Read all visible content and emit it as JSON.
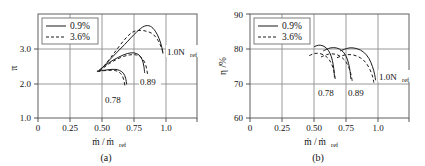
{
  "figure": {
    "panel_count": 2
  },
  "chart_data": [
    {
      "type": "line",
      "panel": "a",
      "caption": "(a)",
      "title": "",
      "xlabel": "ṁ / ṁref",
      "xlabel_main": "ṁ / ṁ",
      "xlabel_sub": "ref",
      "ylabel": "π",
      "xlim": [
        0,
        1.22
      ],
      "ylim": [
        1.0,
        3.97
      ],
      "xticks": [
        0,
        0.25,
        0.5,
        0.75,
        1.0
      ],
      "xtick_labels": [
        "0",
        "0.25",
        "0.50",
        "0.75",
        "1.0"
      ],
      "yticks": [
        1.0,
        2.0,
        3.0
      ],
      "ytick_labels": [
        "1.0",
        "2.0",
        "3.0"
      ],
      "grid": true,
      "legend_position": "top-left",
      "legend": [
        {
          "label": "0.9%",
          "style": "solid"
        },
        {
          "label": "3.6%",
          "style": "dashed"
        }
      ],
      "annotations": [
        {
          "text": "1.0Nref",
          "text_main": "1.0N",
          "text_sub": "ref",
          "x": 1.02,
          "y": 2.73
        },
        {
          "text": "0.89",
          "x": 0.84,
          "y": 2.13
        },
        {
          "text": "0.78",
          "x": 0.59,
          "y": 1.61
        }
      ],
      "series": [
        {
          "name": "0.78 speedline, 0.9%",
          "style": "solid",
          "speed": "0.78",
          "tip": "0.9%",
          "points": [
            [
              0.455,
              2.34
            ],
            [
              0.5,
              2.36
            ],
            [
              0.545,
              2.38
            ],
            [
              0.59,
              2.39
            ],
            [
              0.625,
              2.36
            ],
            [
              0.655,
              2.28
            ],
            [
              0.672,
              2.14
            ],
            [
              0.68,
              1.97
            ]
          ]
        },
        {
          "name": "0.78 speedline, 3.6%",
          "style": "dashed",
          "speed": "0.78",
          "tip": "3.6%",
          "points": [
            [
              0.455,
              2.33
            ],
            [
              0.5,
              2.35
            ],
            [
              0.545,
              2.36
            ],
            [
              0.585,
              2.36
            ],
            [
              0.618,
              2.32
            ],
            [
              0.645,
              2.22
            ],
            [
              0.66,
              2.06
            ],
            [
              0.666,
              1.92
            ]
          ]
        },
        {
          "name": "0.89 speedline, 0.9%",
          "style": "solid",
          "speed": "0.89",
          "tip": "0.9%",
          "points": [
            [
              0.47,
              2.37
            ],
            [
              0.545,
              2.58
            ],
            [
              0.62,
              2.74
            ],
            [
              0.685,
              2.84
            ],
            [
              0.735,
              2.86
            ],
            [
              0.775,
              2.8
            ],
            [
              0.8,
              2.66
            ],
            [
              0.812,
              2.48
            ],
            [
              0.818,
              2.3
            ]
          ]
        },
        {
          "name": "0.89 speedline, 3.6%",
          "style": "dashed",
          "speed": "0.89",
          "tip": "3.6%",
          "points": [
            [
              0.47,
              2.34
            ],
            [
              0.55,
              2.56
            ],
            [
              0.63,
              2.72
            ],
            [
              0.7,
              2.8
            ],
            [
              0.755,
              2.8
            ],
            [
              0.795,
              2.72
            ],
            [
              0.822,
              2.56
            ],
            [
              0.836,
              2.36
            ],
            [
              0.842,
              2.2
            ]
          ]
        },
        {
          "name": "1.0 speedline, 0.9%",
          "style": "solid",
          "speed": "1.0",
          "tip": "0.9%",
          "points": [
            [
              0.465,
              2.32
            ],
            [
              0.565,
              2.72
            ],
            [
              0.665,
              3.1
            ],
            [
              0.755,
              3.45
            ],
            [
              0.815,
              3.62
            ],
            [
              0.862,
              3.62
            ],
            [
              0.9,
              3.48
            ],
            [
              0.93,
              3.26
            ],
            [
              0.95,
              3.02
            ],
            [
              0.958,
              2.85
            ]
          ]
        },
        {
          "name": "1.0 speedline, 3.6%",
          "style": "dashed",
          "speed": "1.0",
          "tip": "3.6%",
          "points": [
            [
              0.505,
              2.47
            ],
            [
              0.585,
              2.86
            ],
            [
              0.66,
              3.22
            ],
            [
              0.72,
              3.44
            ],
            [
              0.775,
              3.5
            ],
            [
              0.83,
              3.48
            ],
            [
              0.88,
              3.4
            ],
            [
              0.92,
              3.22
            ],
            [
              0.948,
              3.0
            ],
            [
              0.962,
              2.82
            ]
          ]
        }
      ]
    },
    {
      "type": "line",
      "panel": "b",
      "caption": "(b)",
      "title": "",
      "xlabel": "ṁ / ṁref",
      "xlabel_main": "ṁ / ṁ",
      "xlabel_sub": "ref",
      "ylabel": "η /%",
      "xlim": [
        0,
        1.22
      ],
      "ylim": [
        60,
        90
      ],
      "xticks": [
        0,
        0.25,
        0.5,
        0.75,
        1.0
      ],
      "xtick_labels": [
        "0",
        "0.25",
        "0.50",
        "0.75",
        "1.0"
      ],
      "yticks": [
        60,
        70,
        80,
        90
      ],
      "ytick_labels": [
        "60",
        "70",
        "80",
        "90"
      ],
      "grid": true,
      "legend_position": "top-left",
      "legend": [
        {
          "label": "0.9%",
          "style": "solid"
        },
        {
          "label": "3.6%",
          "style": "dashed"
        }
      ],
      "annotations": [
        {
          "text": "1.0Nref",
          "text_main": "1.0N",
          "text_sub": "ref",
          "x": 1.02,
          "y": 72.2
        },
        {
          "text": "0.89",
          "x": 0.8,
          "y": 67.8
        },
        {
          "text": "0.78",
          "x": 0.645,
          "y": 67.8
        }
      ],
      "series": [
        {
          "name": "0.78 speedline, 0.9%",
          "style": "solid",
          "speed": "0.78",
          "tip": "0.9%",
          "points": [
            [
              0.495,
              80.6
            ],
            [
              0.525,
              81.0
            ],
            [
              0.56,
              80.8
            ],
            [
              0.59,
              80.0
            ],
            [
              0.615,
              78.6
            ],
            [
              0.632,
              76.6
            ],
            [
              0.643,
              74.2
            ],
            [
              0.648,
              71.8
            ]
          ]
        },
        {
          "name": "0.78 speedline, 3.6%",
          "style": "dashed",
          "speed": "0.78",
          "tip": "3.6%",
          "points": [
            [
              0.455,
              78.0
            ],
            [
              0.495,
              78.6
            ],
            [
              0.535,
              78.6
            ],
            [
              0.575,
              78.0
            ],
            [
              0.608,
              76.8
            ],
            [
              0.632,
              75.0
            ],
            [
              0.648,
              72.8
            ],
            [
              0.655,
              70.8
            ]
          ]
        },
        {
          "name": "0.89 speedline, 0.9%",
          "style": "solid",
          "speed": "0.89",
          "tip": "0.9%",
          "points": [
            [
              0.565,
              79.4
            ],
            [
              0.615,
              80.2
            ],
            [
              0.665,
              80.2
            ],
            [
              0.705,
              79.4
            ],
            [
              0.735,
              78.0
            ],
            [
              0.756,
              75.8
            ],
            [
              0.768,
              73.4
            ],
            [
              0.773,
              71.4
            ]
          ]
        },
        {
          "name": "0.89 speedline, 3.6%",
          "style": "dashed",
          "speed": "0.89",
          "tip": "3.6%",
          "points": [
            [
              0.545,
              77.6
            ],
            [
              0.6,
              78.4
            ],
            [
              0.655,
              78.4
            ],
            [
              0.7,
              77.6
            ],
            [
              0.736,
              76.2
            ],
            [
              0.762,
              74.2
            ],
            [
              0.778,
              72.0
            ],
            [
              0.785,
              70.4
            ]
          ]
        },
        {
          "name": "1.0 speedline, 0.9%",
          "style": "solid",
          "speed": "1.0",
          "tip": "0.9%",
          "points": [
            [
              0.695,
              79.4
            ],
            [
              0.76,
              80.2
            ],
            [
              0.82,
              80.0
            ],
            [
              0.872,
              79.0
            ],
            [
              0.912,
              77.2
            ],
            [
              0.94,
              74.8
            ],
            [
              0.956,
              72.6
            ],
            [
              0.963,
              71.0
            ]
          ]
        },
        {
          "name": "1.0 speedline, 3.6%",
          "style": "dashed",
          "speed": "1.0",
          "tip": "3.6%",
          "points": [
            [
              0.668,
              77.4
            ],
            [
              0.73,
              78.2
            ],
            [
              0.79,
              78.2
            ],
            [
              0.845,
              77.4
            ],
            [
              0.888,
              76.0
            ],
            [
              0.92,
              74.0
            ],
            [
              0.942,
              71.8
            ],
            [
              0.95,
              70.2
            ]
          ]
        }
      ]
    }
  ]
}
